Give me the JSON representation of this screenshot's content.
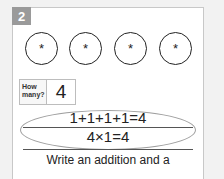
{
  "question": {
    "number": "2",
    "circles": [
      {
        "symbol": "*"
      },
      {
        "symbol": "*"
      },
      {
        "symbol": "*"
      },
      {
        "symbol": "*"
      }
    ],
    "how_many": {
      "label": "How many?",
      "value": "4"
    },
    "equations": {
      "addition": "1+1+1+1=4",
      "multiplication": "4×1=4"
    },
    "instruction": "Write an addition and a"
  },
  "colors": {
    "badge": "#9a9a9a",
    "page_background": "#f2f2f2",
    "card_background": "#ffffff"
  }
}
